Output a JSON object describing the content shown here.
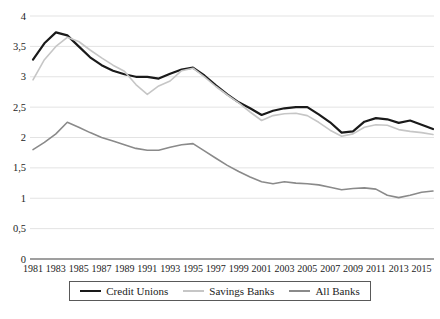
{
  "figure": {
    "background": "#ffffff",
    "colors": {
      "gridline": "#e3e3e3",
      "axis_line": "#404040",
      "tick_text": "#1c1c1c",
      "legend_border": "#595959"
    }
  },
  "chart_data": {
    "type": "line",
    "title": "",
    "xlabel": "",
    "ylabel": "",
    "ylim": [
      0,
      4
    ],
    "y_step": 0.5,
    "grid": "horizontal",
    "legend_position": "bottom",
    "y_tick_labels": [
      "0",
      "0,5",
      "1",
      "1,5",
      "2",
      "2,5",
      "3",
      "3,5",
      "4"
    ],
    "x": [
      1981,
      1982,
      1983,
      1984,
      1985,
      1986,
      1987,
      1988,
      1989,
      1990,
      1991,
      1992,
      1993,
      1994,
      1995,
      1996,
      1997,
      1998,
      1999,
      2000,
      2001,
      2002,
      2003,
      2004,
      2005,
      2006,
      2007,
      2008,
      2009,
      2010,
      2011,
      2012,
      2013,
      2014,
      2015,
      2016
    ],
    "x_tick_labels": [
      "1981",
      "1983",
      "1985",
      "1987",
      "1989",
      "1991",
      "1993",
      "1995",
      "1997",
      "1999",
      "2001",
      "2003",
      "2005",
      "2007",
      "2009",
      "2011",
      "2013",
      "2015"
    ],
    "series": [
      {
        "name": "Credit Unions",
        "color": "#1a1a1a",
        "stroke_width": 2.2,
        "values": [
          3.28,
          3.55,
          3.73,
          3.68,
          3.5,
          3.32,
          3.19,
          3.1,
          3.04,
          3.0,
          3.0,
          2.97,
          3.05,
          3.12,
          3.15,
          3.02,
          2.86,
          2.71,
          2.58,
          2.48,
          2.37,
          2.44,
          2.48,
          2.5,
          2.5,
          2.38,
          2.25,
          2.08,
          2.1,
          2.26,
          2.32,
          2.3,
          2.24,
          2.28,
          2.21,
          2.14
        ]
      },
      {
        "name": "Savings Banks",
        "color": "#c6c6c6",
        "stroke_width": 1.6,
        "values": [
          2.95,
          3.28,
          3.5,
          3.65,
          3.58,
          3.44,
          3.31,
          3.19,
          3.09,
          2.87,
          2.71,
          2.85,
          2.93,
          3.1,
          3.14,
          3.0,
          2.84,
          2.7,
          2.57,
          2.42,
          2.28,
          2.36,
          2.39,
          2.4,
          2.36,
          2.25,
          2.12,
          2.02,
          2.06,
          2.17,
          2.21,
          2.2,
          2.13,
          2.1,
          2.08,
          2.05
        ]
      },
      {
        "name": "All Banks",
        "color": "#8a8a8a",
        "stroke_width": 1.6,
        "values": [
          1.8,
          1.92,
          2.06,
          2.25,
          2.17,
          2.08,
          2.0,
          1.94,
          1.88,
          1.82,
          1.79,
          1.79,
          1.84,
          1.88,
          1.9,
          1.78,
          1.66,
          1.54,
          1.44,
          1.35,
          1.27,
          1.24,
          1.27,
          1.25,
          1.24,
          1.22,
          1.18,
          1.14,
          1.16,
          1.17,
          1.15,
          1.05,
          1.01,
          1.05,
          1.1,
          1.12
        ]
      }
    ]
  }
}
